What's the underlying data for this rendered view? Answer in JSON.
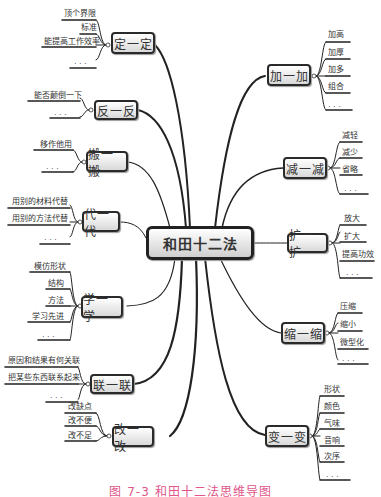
{
  "center": {
    "label": "和田十二法"
  },
  "branches": [
    {
      "id": "ding",
      "label": "定一定",
      "items": [
        "顶个界限",
        "标准",
        "能提高工作效率",
        "..."
      ]
    },
    {
      "id": "fan",
      "label": "反一反",
      "items": [
        "能否颠倒一下",
        "..."
      ]
    },
    {
      "id": "ban",
      "label": "搬一搬",
      "items": [
        "移作他用",
        "..."
      ]
    },
    {
      "id": "dai",
      "label": "代一代",
      "items": [
        "用别的材料代替",
        "用别的方法代替",
        "..."
      ]
    },
    {
      "id": "xue",
      "label": "学一学",
      "items": [
        "模仿形状",
        "结构",
        "方法",
        "学习先进",
        "..."
      ]
    },
    {
      "id": "lian",
      "label": "联一联",
      "items": [
        "原因和结果有何关联",
        "把某些东西联系起来",
        "..."
      ]
    },
    {
      "id": "gai",
      "label": "改一改",
      "items": [
        "改缺点",
        "改不便",
        "改不足"
      ]
    },
    {
      "id": "jia",
      "label": "加一加",
      "items": [
        "加高",
        "加厚",
        "加多",
        "组合",
        "..."
      ]
    },
    {
      "id": "jian",
      "label": "减一减",
      "items": [
        "减轻",
        "减少",
        "省略",
        "..."
      ]
    },
    {
      "id": "kuo",
      "label": "扩一扩",
      "items": [
        "放大",
        "扩大",
        "提高功效",
        "..."
      ]
    },
    {
      "id": "suo",
      "label": "缩一缩",
      "items": [
        "压缩",
        "缩小",
        "微型化",
        "..."
      ]
    },
    {
      "id": "bian",
      "label": "变一变",
      "items": [
        "形状",
        "颜色",
        "气味",
        "音响",
        "次序",
        "..."
      ]
    }
  ],
  "caption": "图 7-3   和田十二法思维导图",
  "colors": {
    "caption": "#e0558a",
    "node_border": "#2a2a2a",
    "line": "#222222"
  }
}
